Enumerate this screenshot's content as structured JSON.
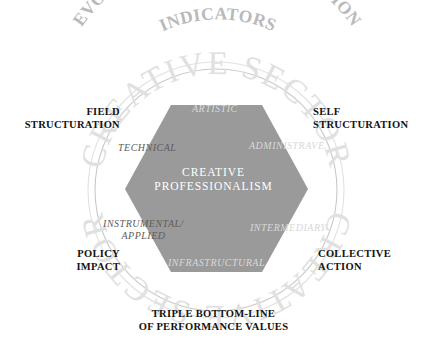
{
  "figure": {
    "title_arc_outer": "EVOLVING PROFESSIONALIZATION",
    "title_arc_inner": "INDICATORS",
    "watermark": "CREATIVE SECTOR",
    "core": {
      "line1": "CREATIVE",
      "line2": "PROFESSIONALISM"
    },
    "hex_facets": [
      {
        "key": "artistic",
        "label": "ARTISTIC"
      },
      {
        "key": "administrave",
        "label": "ADMINISTRAVE"
      },
      {
        "key": "intermediary",
        "label": "INTERMEDIARY"
      },
      {
        "key": "infrastructural",
        "label": "INFRASTRUCTURAL"
      },
      {
        "key": "instrumental_applied_line1",
        "label": "INSTRUMENTAL/"
      },
      {
        "key": "instrumental_applied_line2",
        "label": "APPLIED"
      },
      {
        "key": "technical",
        "label": "TECHNICAL"
      }
    ],
    "outer_labels": [
      {
        "key": "field_structuration_line1",
        "label": "FIELD"
      },
      {
        "key": "field_structuration_line2",
        "label": "STRUCTURATION"
      },
      {
        "key": "self_structuration_line1",
        "label": "SELF"
      },
      {
        "key": "self_structuration_line2",
        "label": "STRUCTURATION"
      },
      {
        "key": "policy_impact_line1",
        "label": "POLICY"
      },
      {
        "key": "policy_impact_line2",
        "label": "IMPACT"
      },
      {
        "key": "collective_action_line1",
        "label": "COLLECTIVE"
      },
      {
        "key": "collective_action_line2",
        "label": "ACTION"
      },
      {
        "key": "triple_bottom_line1",
        "label": "TRIPLE BOTTOM-LINE"
      },
      {
        "key": "triple_bottom_line2",
        "label": "OF PERFORMANCE VALUES"
      }
    ],
    "colors": {
      "hexagon_fill": "#9a9a9a",
      "circle_stroke": "#c9c9c9",
      "arc_text": "#b9b9b9",
      "watermark_text": "#e0e0e0",
      "label_text": "#121212",
      "facet_text": "#5d5d5d",
      "core_text": "#ffffff",
      "background": "#ffffff"
    }
  }
}
